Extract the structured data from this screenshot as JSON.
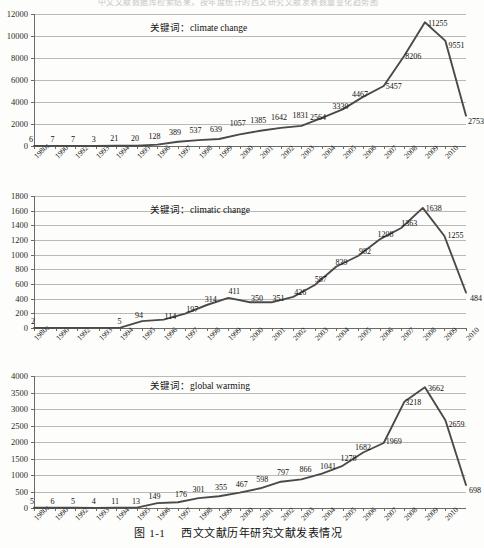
{
  "page": {
    "bleed_text": "中文文献数据库检索结果，按年度统计的西文研究文献发表数量变化趋势图",
    "caption_prefix": "图",
    "caption_number": "1-1",
    "caption_text": "西文文献历年研究文献发表情况"
  },
  "common": {
    "keyword_label": "关键词：",
    "x_categories": [
      "1980s",
      "1990",
      "1992",
      "1993",
      "1994",
      "1995",
      "1996",
      "1997",
      "1998",
      "1999",
      "2000",
      "2001",
      "2002",
      "2003",
      "2004",
      "2005",
      "2006",
      "2007",
      "2008",
      "2009",
      "2010"
    ],
    "line_color": "#4a4a4a",
    "grid_color": "#b9b9b5",
    "axis_color": "#6b6b68"
  },
  "chart_data": [
    {
      "id": "climate-change",
      "type": "line",
      "title": "关键词：climate change",
      "keyword": "climate change",
      "xlabel": "",
      "ylabel": "",
      "ylim": [
        0,
        12000
      ],
      "yticks": [
        0,
        2000,
        4000,
        6000,
        8000,
        10000,
        12000
      ],
      "grid": true,
      "legend": "none",
      "categories": [
        "1980s",
        "1990",
        "1992",
        "1993",
        "1994",
        "1995",
        "1996",
        "1997",
        "1998",
        "1999",
        "2000",
        "2001",
        "2002",
        "2003",
        "2004",
        "2005",
        "2006",
        "2007",
        "2008",
        "2009",
        "2010"
      ],
      "values": [
        6,
        7,
        7,
        3,
        21,
        20,
        128,
        389,
        537,
        639,
        1057,
        1385,
        1642,
        1831,
        2564,
        3330,
        4467,
        5457,
        8206,
        11255,
        9551,
        2753
      ]
    },
    {
      "id": "climatic-change",
      "type": "line",
      "title": "关键词：climatic change",
      "keyword": "climatic change",
      "xlabel": "",
      "ylabel": "",
      "ylim": [
        0,
        1800
      ],
      "yticks": [
        0,
        200,
        400,
        600,
        800,
        1000,
        1200,
        1400,
        1600,
        1800
      ],
      "grid": true,
      "legend": "none",
      "categories": [
        "1980s",
        "1990",
        "1992",
        "1993",
        "1994",
        "1995",
        "1996",
        "1997",
        "1998",
        "1999",
        "2000",
        "2001",
        "2002",
        "2003",
        "2004",
        "2005",
        "2006",
        "2007",
        "2008",
        "2009",
        "2010"
      ],
      "values": [
        2,
        2,
        2,
        2,
        5,
        94,
        114,
        197,
        314,
        411,
        350,
        351,
        426,
        587,
        839,
        982,
        1208,
        1363,
        1638,
        1255,
        484
      ]
    },
    {
      "id": "global-warming",
      "type": "line",
      "title": "关键词：global warming",
      "keyword": "global warming",
      "xlabel": "",
      "ylabel": "",
      "ylim": [
        0,
        4000
      ],
      "yticks": [
        0,
        500,
        1000,
        1500,
        2000,
        2500,
        3000,
        3500,
        4000
      ],
      "grid": true,
      "legend": "none",
      "categories": [
        "1980s",
        "1990",
        "1992",
        "1993",
        "1994",
        "1995",
        "1996",
        "1997",
        "1998",
        "1999",
        "2000",
        "2001",
        "2002",
        "2003",
        "2004",
        "2005",
        "2006",
        "2007",
        "2008",
        "2009",
        "2010"
      ],
      "values": [
        5,
        6,
        5,
        4,
        11,
        13,
        149,
        176,
        301,
        355,
        467,
        598,
        797,
        866,
        1041,
        1278,
        1682,
        1969,
        3218,
        3662,
        2659,
        698
      ]
    }
  ],
  "charts_meta": [
    {
      "labels": [
        {
          "v": "6"
        },
        {
          "v": "7"
        },
        {
          "v": "7"
        },
        {
          "v": "3"
        },
        {
          "v": "21"
        },
        {
          "v": "20"
        },
        {
          "v": "128"
        },
        {
          "v": "389"
        },
        {
          "v": "537"
        },
        {
          "v": "639"
        },
        {
          "v": "1057"
        },
        {
          "v": "1385"
        },
        {
          "v": "1642"
        },
        {
          "v": "1831"
        },
        {
          "v": "2564"
        },
        {
          "v": "3330"
        },
        {
          "v": "4467"
        },
        {
          "v": "5457"
        },
        {
          "v": "8206"
        },
        {
          "v": "11255"
        },
        {
          "v": "9551"
        },
        {
          "v": "2753"
        }
      ]
    },
    {
      "labels": [
        {
          "v": "2"
        },
        {
          "v": "5"
        },
        {
          "v": "94"
        },
        {
          "v": "114"
        },
        {
          "v": "197"
        },
        {
          "v": "314"
        },
        {
          "v": "411"
        },
        {
          "v": "350"
        },
        {
          "v": "351"
        },
        {
          "v": "426"
        },
        {
          "v": "587"
        },
        {
          "v": "839"
        },
        {
          "v": "982"
        },
        {
          "v": "1208"
        },
        {
          "v": "1363"
        },
        {
          "v": "1638"
        },
        {
          "v": "1255"
        },
        {
          "v": "484"
        }
      ]
    },
    {
      "labels": [
        {
          "v": "5"
        },
        {
          "v": "6"
        },
        {
          "v": "5"
        },
        {
          "v": "4"
        },
        {
          "v": "11"
        },
        {
          "v": "13"
        },
        {
          "v": "149"
        },
        {
          "v": "176"
        },
        {
          "v": "301"
        },
        {
          "v": "355"
        },
        {
          "v": "467"
        },
        {
          "v": "598"
        },
        {
          "v": "797"
        },
        {
          "v": "866"
        },
        {
          "v": "1041"
        },
        {
          "v": "1278"
        },
        {
          "v": "1682"
        },
        {
          "v": "1969"
        },
        {
          "v": "3218"
        },
        {
          "v": "3662"
        },
        {
          "v": "2659"
        },
        {
          "v": "698"
        }
      ]
    }
  ]
}
